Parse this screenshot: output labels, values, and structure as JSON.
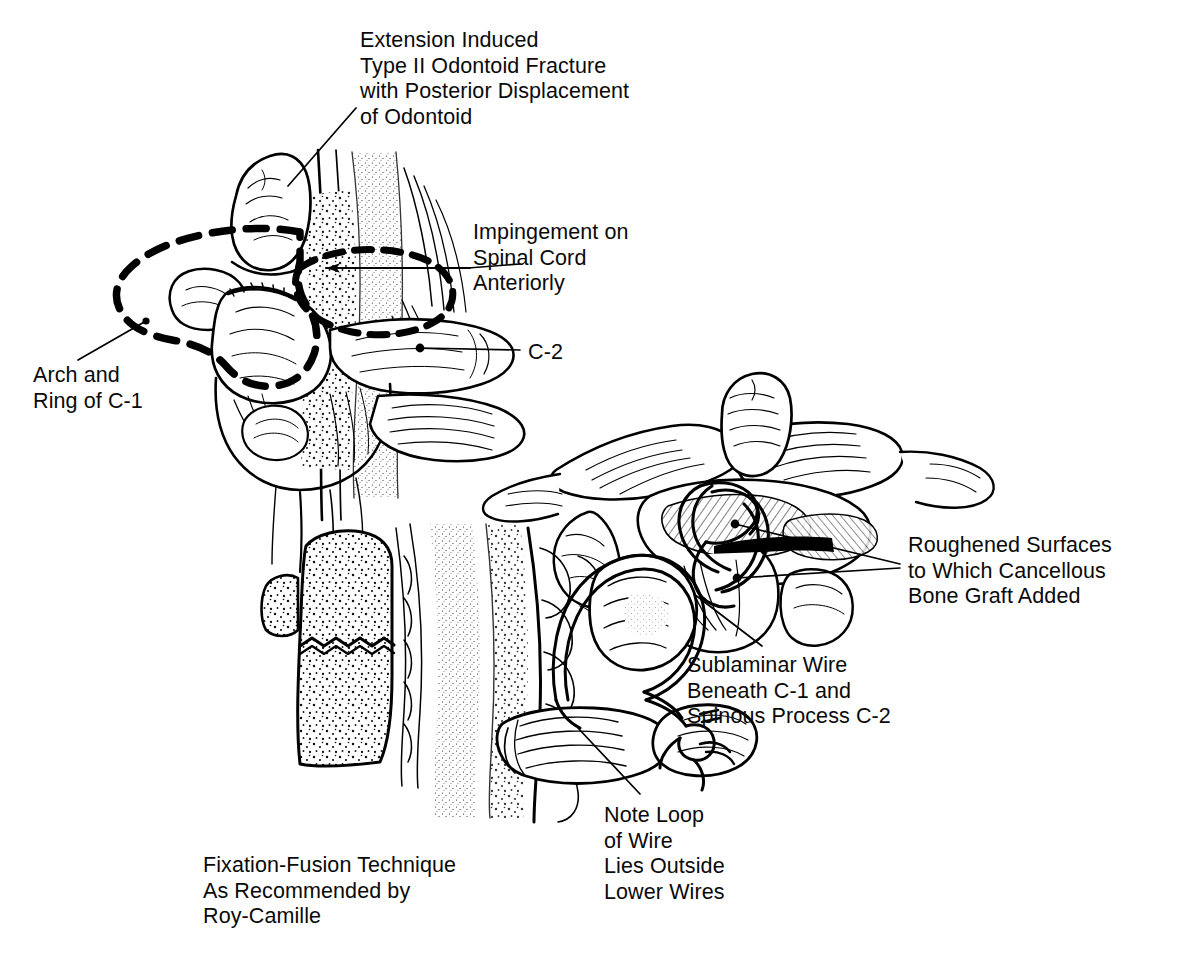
{
  "figure": {
    "kind": "medical-line-illustration",
    "background_color": "#ffffff",
    "ink_color": "#000000",
    "panels": [
      {
        "id": "lateral-c1-c2",
        "name": "Lateral view of C1-C2 with displaced odontoid",
        "position": "top-left"
      },
      {
        "id": "posterior-c1-c2-wiring",
        "name": "Posterior view of C1-C2 with sublaminar wires and bone graft",
        "position": "middle-right"
      },
      {
        "id": "sagittal-graft-wire",
        "name": "Sagittal view of bone graft and wire loops",
        "position": "bottom-center"
      }
    ]
  },
  "labels": {
    "title": "Extension Induced\nType II Odontoid Fracture\nwith Posterior Displacement\nof Odontoid",
    "impingement": "Impingement on\nSpinal Cord\nAnteriorly",
    "arch_ring": "Arch and\nRing of C-1",
    "c2": "C-2",
    "roughened": "Roughened Surfaces\nto Which Cancellous\nBone Graft Added",
    "sublaminar": "Sublaminar Wire\nBeneath C-1 and\nSpinous Process C-2",
    "note_loop": "Note Loop\nof Wire\nLies Outside\nLower Wires",
    "fixation": "Fixation-Fusion Technique\nAs Recommended by\nRoy-Camille"
  }
}
